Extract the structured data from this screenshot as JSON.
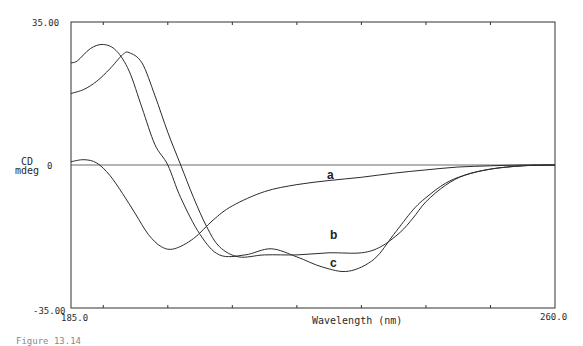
{
  "chart_data": {
    "type": "line",
    "title": "",
    "xlabel": "Wavelength (nm)",
    "ylabel": "CD mdeg",
    "xlim": [
      185.0,
      260.0
    ],
    "ylim": [
      -35.0,
      35.0
    ],
    "x_tick_labels": [
      "185.0",
      "260.0"
    ],
    "y_tick_labels": [
      "35.00",
      "0",
      "-35.00"
    ],
    "minor_ticks_x": [
      190,
      200,
      210,
      220,
      230,
      240,
      250
    ],
    "grid": false,
    "zero_line": true,
    "legend": "inline curve labels",
    "series": [
      {
        "name": "a",
        "x": [
          185,
          187,
          189,
          191,
          193,
          195,
          197,
          199,
          201,
          204,
          207,
          210,
          215,
          220,
          225,
          230,
          235,
          240,
          245,
          250,
          255,
          260
        ],
        "values": [
          0.8,
          1.3,
          0.5,
          -2.5,
          -7,
          -12,
          -17,
          -20,
          -20.5,
          -18,
          -13.5,
          -10,
          -6.5,
          -4.8,
          -3.8,
          -3,
          -2,
          -1.2,
          -0.5,
          -0.2,
          0,
          0
        ]
      },
      {
        "name": "b",
        "x": [
          185,
          187,
          189,
          191,
          193,
          194,
          196,
          198,
          200,
          202,
          204,
          206,
          208,
          211,
          215,
          220,
          225,
          230,
          233,
          236,
          238,
          240,
          243,
          246,
          250,
          255,
          260
        ],
        "values": [
          17.5,
          18.5,
          20.5,
          23.5,
          27,
          27.5,
          25,
          17,
          8,
          0,
          -8,
          -15,
          -20,
          -22.5,
          -22,
          -22,
          -21.5,
          -21.5,
          -20,
          -16.5,
          -13,
          -9,
          -5,
          -2.5,
          -1,
          -0.2,
          0
        ]
      },
      {
        "name": "c",
        "x": [
          185,
          186,
          188,
          190,
          192,
          194,
          196,
          198,
          200,
          202,
          205,
          208,
          212,
          216,
          220,
          224,
          228,
          232,
          235,
          238,
          240,
          243,
          246,
          250,
          255,
          260
        ],
        "values": [
          25,
          25.5,
          28.5,
          29.5,
          28,
          23,
          14,
          5,
          0,
          -8,
          -17,
          -22,
          -22,
          -20.5,
          -22.5,
          -25,
          -26,
          -23,
          -17,
          -11,
          -8,
          -4.5,
          -2.5,
          -1,
          -0.2,
          0
        ]
      }
    ],
    "curve_labels": [
      {
        "text": "a",
        "x": 232,
        "y": -2.5
      },
      {
        "text": "b",
        "x": 233,
        "y": -17
      },
      {
        "text": "c",
        "x": 233,
        "y": -28
      }
    ]
  },
  "axis": {
    "y_top": "35.00",
    "y_zero": "0",
    "y_bottom": "-35.00",
    "y_label_line1": "CD",
    "y_label_line2": "mdeg",
    "x_start": "185.0",
    "x_end": "260.0",
    "x_label": "Wavelength (nm)"
  },
  "caption": "Figure 13.14"
}
